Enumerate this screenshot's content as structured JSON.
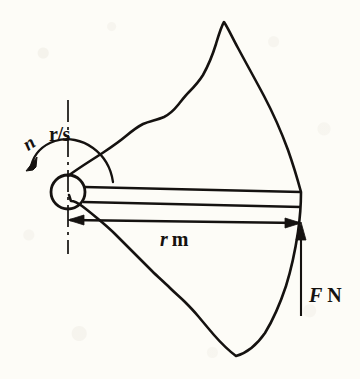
{
  "figure": {
    "kind": "mechanical-engineering-diagram",
    "background_color": "#fdfcf7",
    "ink_color": "#151210"
  },
  "labels": {
    "rotation_speed": {
      "text": "r/s",
      "meaning": "revolutions per second",
      "x": 49,
      "y": 124
    },
    "rotation_symbol": {
      "text": "n",
      "meaning": "rotational speed symbol",
      "x": 19,
      "y": 138
    },
    "radius": {
      "symbol": "r",
      "unit": "m",
      "text": "r m",
      "meaning": "wheel radius in metres",
      "x": 160,
      "y": 229
    },
    "force": {
      "symbol": "F",
      "unit": "N",
      "text": "F N",
      "meaning": "tangential force in newtons",
      "x": 309,
      "y": 285
    }
  },
  "geometry": {
    "hub": {
      "cx": 68,
      "cy": 192,
      "r": 17
    },
    "centerline": {
      "x": 68,
      "y1": 100,
      "y2": 254
    },
    "radius_dimension": {
      "x1": 68,
      "x2": 301,
      "y": 221
    },
    "force_arrow": {
      "x": 301,
      "y_tip": 226,
      "y_tail": 316,
      "direction": "up"
    },
    "rotation_arc": {
      "direction": "counter-clockwise",
      "arrow_at": "lower-left"
    },
    "wheel_peak": {
      "x": 224,
      "y": 22
    },
    "wheel_bottom_vertex": {
      "x": 236,
      "y": 356
    },
    "wheel_right_extent": {
      "x": 301
    }
  }
}
